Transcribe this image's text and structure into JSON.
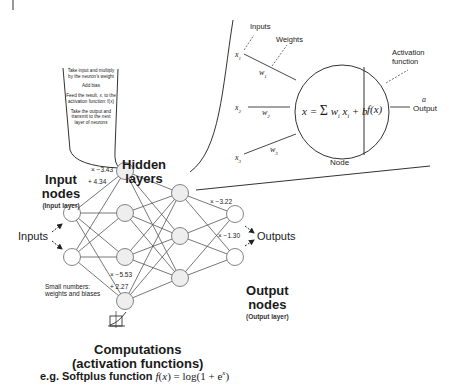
{
  "callout": {
    "steps": [
      "Take input and multiply by the neuron's weight",
      "Add bias",
      "Feed the result, x, to the activation function: f(x)",
      "Take the output and transmit to the next layer of neurons"
    ]
  },
  "labels": {
    "hidden_layers_line1": "Hidden",
    "hidden_layers_line2": "layers",
    "input_nodes_line1": "Input",
    "input_nodes_line2": "nodes",
    "input_layer": "(Input layer)",
    "inputs": "Inputs",
    "outputs": "Outputs",
    "output_nodes_line1": "Output",
    "output_nodes_line2": "nodes",
    "output_layer": "(Output layer)",
    "small_numbers_line1": "Small numbers:",
    "small_numbers_line2": "weights and biases",
    "computations_line1": "Computations",
    "computations_line2": "(activation functions)",
    "softplus_prefix": "e.g. Softplus function",
    "softplus_formula": "f(x) = log(1 + e^x)"
  },
  "weights": {
    "top_w": "× −3.43",
    "top_b": "+ 4.34",
    "bottom_w": "× −5.53",
    "bottom_b": "+ 2.27",
    "out_w1": "× −3.22",
    "out_w2": "× −1.30"
  },
  "node_detail": {
    "inputs_label": "Inputs",
    "weights_label": "Weights",
    "x1": "x1",
    "x2": "x2",
    "x3": "x3",
    "w1": "w1",
    "w2": "w2",
    "w3": "w3",
    "formula": "x = Σ wi xi + b",
    "activation": "f(x)",
    "activation_label_line1": "Activation",
    "activation_label_line2": "function",
    "output_symbol": "a",
    "output_label": "Output",
    "node_label": "Node"
  },
  "network": {
    "layers": [
      {
        "name": "input",
        "nodes": [
          [
            72,
            213
          ],
          [
            72,
            257
          ]
        ]
      },
      {
        "name": "hidden1",
        "nodes": [
          [
            125,
            171
          ],
          [
            125,
            213
          ],
          [
            125,
            257
          ],
          [
            125,
            301
          ]
        ]
      },
      {
        "name": "hidden2",
        "nodes": [
          [
            180,
            193
          ],
          [
            180,
            236
          ],
          [
            180,
            278
          ]
        ]
      },
      {
        "name": "output",
        "nodes": [
          [
            235,
            214
          ],
          [
            235,
            257
          ]
        ]
      }
    ],
    "node_radius": 8.5,
    "node_fill": "#eeeeee",
    "edge_color": "#555555"
  }
}
